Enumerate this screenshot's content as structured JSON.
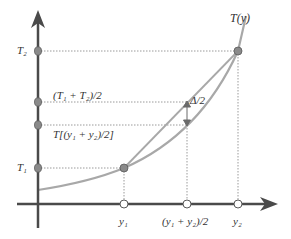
{
  "diagram": {
    "curve_label": "T(y)",
    "y_axis_labels": {
      "t2": "T₂",
      "t_mid_avg": "(T₁ + T₂)/2",
      "t_of_mid": "T[(y₁ + y₂)/2]",
      "t1": "T₁"
    },
    "x_axis_labels": {
      "y1": "y₁",
      "y_mid": "(y₁ + y₂)/2",
      "y2": "y₂"
    },
    "delta_label": "Δ/2",
    "colors": {
      "axis": "#4a4a4a",
      "curve": "#a8a8a8",
      "chord": "#a8a8a8",
      "point_fill": "#8a8a8a",
      "open_point_fill": "#ffffff",
      "guide": "#9a9a9a"
    }
  }
}
